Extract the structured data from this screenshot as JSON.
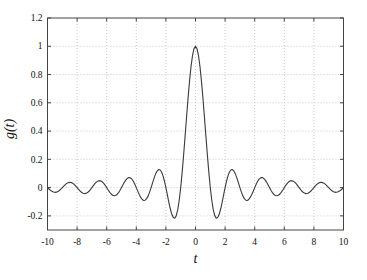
{
  "chart_data": {
    "type": "line",
    "title": "",
    "xlabel": "t",
    "ylabel": "g(t)",
    "xlim": [
      -10,
      10
    ],
    "ylim": [
      -0.3,
      1.2
    ],
    "xticks": [
      -10,
      -8,
      -6,
      -4,
      -2,
      0,
      2,
      4,
      6,
      8,
      10
    ],
    "xtick_labels": [
      "-10",
      "-8",
      "-6",
      "-4",
      "-2",
      "0",
      "2",
      "4",
      "6",
      "8",
      "10"
    ],
    "yticks": [
      -0.2,
      0,
      0.2,
      0.4,
      0.6,
      0.8,
      1,
      1.2
    ],
    "ytick_labels": [
      "-0.2",
      "0",
      "0.2",
      "0.4",
      "0.6",
      "0.8",
      "1",
      "1.2"
    ],
    "grid": true,
    "grid_style": "dotted",
    "legend": "none",
    "colors": {
      "curve": "#3a3a3a",
      "grid": "#bcbcbc",
      "axis": "#444444",
      "text": "#111111",
      "background": "#ffffff"
    },
    "series": [
      {
        "name": "g(t) = sinc(t) = sin(pi t)/(pi t)",
        "symmetry": "even",
        "x_start": 0,
        "x_step": 0.1,
        "x_end": 10,
        "y": [
          1.0,
          0.9836,
          0.9355,
          0.8584,
          0.7568,
          0.6366,
          0.5046,
          0.3679,
          0.2339,
          0.1093,
          0.0,
          -0.0894,
          -0.1559,
          -0.1981,
          -0.2162,
          -0.2122,
          -0.1892,
          -0.1515,
          -0.1039,
          -0.0518,
          0.0,
          0.0468,
          0.085,
          0.112,
          0.1261,
          0.1273,
          0.1164,
          0.0954,
          0.0668,
          0.0339,
          0.0,
          -0.0317,
          -0.0585,
          -0.078,
          -0.089,
          -0.0909,
          -0.0841,
          -0.0696,
          -0.0492,
          -0.0252,
          0.0,
          0.024,
          0.0445,
          0.0599,
          0.0688,
          0.0707,
          0.0658,
          0.0548,
          0.039,
          0.0201,
          0.0,
          -0.0193,
          -0.036,
          -0.0486,
          -0.0561,
          -0.0579,
          -0.0541,
          -0.0452,
          -0.0323,
          -0.0167,
          0.0,
          0.0161,
          0.0302,
          0.0409,
          0.0473,
          0.049,
          0.0459,
          0.0384,
          0.0275,
          0.0143,
          0.0,
          -0.0139,
          -0.026,
          -0.0353,
          -0.0409,
          -0.0424,
          -0.0398,
          -0.0334,
          -0.024,
          -0.0125,
          0.0,
          0.0121,
          0.0228,
          0.031,
          0.036,
          0.0374,
          0.0352,
          0.0296,
          0.0213,
          0.0111,
          0.0,
          -0.0108,
          -0.0203,
          -0.0277,
          -0.0322,
          -0.0335,
          -0.0315,
          -0.0265,
          -0.0191,
          -0.0099,
          0.0
        ]
      }
    ]
  }
}
